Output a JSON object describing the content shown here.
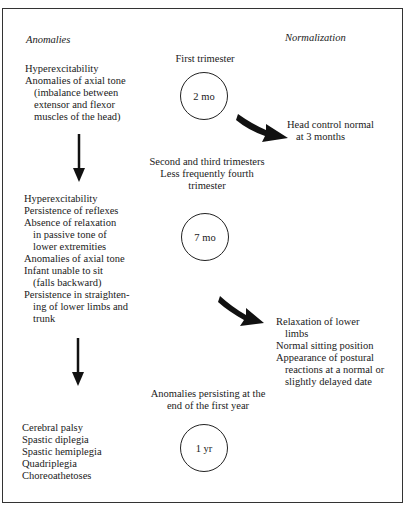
{
  "headers": {
    "left": "Anomalies",
    "right": "Normalization"
  },
  "stages": [
    {
      "period": [
        "First trimester"
      ],
      "age": "2 mo",
      "anomalies": [
        {
          "text": "Hyperexcitability",
          "indent": false
        },
        {
          "text": "Anomalies of axial tone",
          "indent": false
        },
        {
          "text": "(imbalance between",
          "indent": true
        },
        {
          "text": "extensor and flexor",
          "indent": true
        },
        {
          "text": "muscles of the head)",
          "indent": true
        }
      ],
      "normalization": [
        {
          "text": "Head control normal",
          "indent": false
        },
        {
          "text": "at 3 months",
          "indent": true
        }
      ]
    },
    {
      "period": [
        "Second and third trimesters",
        "Less frequently fourth",
        "trimester"
      ],
      "age": "7 mo",
      "anomalies": [
        {
          "text": "Hyperexcitability",
          "indent": false
        },
        {
          "text": "Persistence of reflexes",
          "indent": false
        },
        {
          "text": "Absence of relaxation",
          "indent": false
        },
        {
          "text": "in passive tone of",
          "indent": true
        },
        {
          "text": "lower extremities",
          "indent": true
        },
        {
          "text": "Anomalies of axial tone",
          "indent": false
        },
        {
          "text": "Infant unable to sit",
          "indent": false
        },
        {
          "text": "(falls backward)",
          "indent": true
        },
        {
          "text": "Persistence in straighten-",
          "indent": false
        },
        {
          "text": "ing of lower limbs and",
          "indent": true
        },
        {
          "text": "trunk",
          "indent": true
        }
      ],
      "normalization": [
        {
          "text": "Relaxation of lower",
          "indent": false
        },
        {
          "text": "limbs",
          "indent": true
        },
        {
          "text": "Normal sitting position",
          "indent": false
        },
        {
          "text": "Appearance of postural",
          "indent": false
        },
        {
          "text": "reactions at a normal or",
          "indent": true
        },
        {
          "text": "slightly delayed date",
          "indent": true
        }
      ]
    },
    {
      "period": [
        "Anomalies persisting at the",
        "end of the first year"
      ],
      "age": "1 yr",
      "anomalies": [
        {
          "text": "Cerebral palsy",
          "indent": false
        },
        {
          "text": "Spastic diplegia",
          "indent": false
        },
        {
          "text": "Spastic hemiplegia",
          "indent": false
        },
        {
          "text": "Quadriplegia",
          "indent": false
        },
        {
          "text": "Choreoathetoses",
          "indent": false
        }
      ],
      "normalization": []
    }
  ],
  "icons": {
    "down_arrow": "down-arrow-icon",
    "curved_arrow": "curved-arrow-icon"
  }
}
